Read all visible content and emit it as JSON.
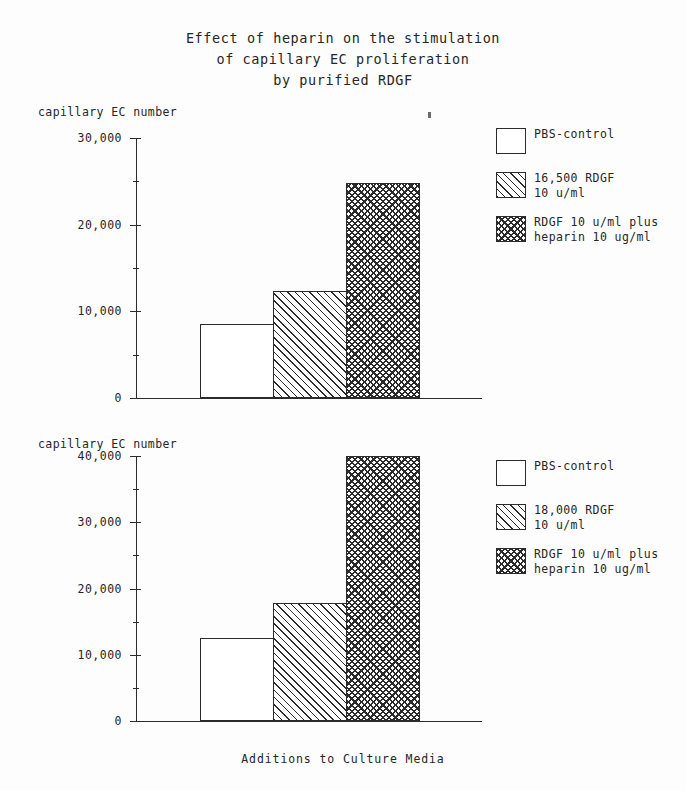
{
  "figure": {
    "title_lines": [
      "Effect of heparin on the stimulation",
      "of capillary EC proliferation",
      "by purified RDGF"
    ],
    "xlabel": "Additions to Culture Media"
  },
  "chart_data": [
    {
      "type": "bar",
      "panel": "top",
      "title": "Effect of heparin on the stimulation of capillary EC proliferation by purified RDGF",
      "ylabel": "capillary EC number",
      "xlabel": "Additions to Culture Media",
      "categories": [
        "PBS-control",
        "16,500 RDGF 10 u/ml",
        "RDGF 10 u/ml plus heparin 10 ug/ml"
      ],
      "values": [
        8500,
        12400,
        24800
      ],
      "ylim": [
        0,
        30000
      ],
      "ytick_labels": [
        "0",
        "10,000",
        "20,000",
        "30,000"
      ],
      "ytick_values": [
        0,
        10000,
        20000,
        30000
      ],
      "yminor_values": [
        5000,
        15000,
        25000
      ],
      "grid": false,
      "legend_position": "right",
      "legend": [
        {
          "pattern": "empty",
          "lines": [
            "PBS-control"
          ]
        },
        {
          "pattern": "hatch",
          "lines": [
            "16,500 RDGF",
            "10 u/ml"
          ]
        },
        {
          "pattern": "cross",
          "lines": [
            "RDGF 10 u/ml plus",
            "heparin 10 ug/ml"
          ]
        }
      ]
    },
    {
      "type": "bar",
      "panel": "bottom",
      "ylabel": "capillary EC number",
      "xlabel": "Additions to Culture Media",
      "categories": [
        "PBS-control",
        "18,000 RDGF 10 u/ml",
        "RDGF 10 u/ml plus heparin 10 ug/ml"
      ],
      "values": [
        12500,
        17800,
        40000
      ],
      "ylim": [
        0,
        40000
      ],
      "ytick_labels": [
        "0",
        "10,000",
        "20,000",
        "30,000",
        "40,000"
      ],
      "ytick_values": [
        0,
        10000,
        20000,
        30000,
        40000
      ],
      "yminor_values": [
        5000,
        15000,
        25000,
        35000
      ],
      "grid": false,
      "legend_position": "right",
      "legend": [
        {
          "pattern": "empty",
          "lines": [
            "PBS-control"
          ]
        },
        {
          "pattern": "hatch",
          "lines": [
            "18,000 RDGF",
            "10 u/ml"
          ]
        },
        {
          "pattern": "cross",
          "lines": [
            "RDGF 10 u/ml plus",
            "heparin 10 ug/ml"
          ]
        }
      ]
    }
  ],
  "top": {
    "ylabel": "capillary EC number",
    "ticks": [
      {
        "label": "30,000",
        "value": 30000
      },
      {
        "label": "20,000",
        "value": 20000
      },
      {
        "label": "10,000",
        "value": 10000
      },
      {
        "label": "0",
        "value": 0
      }
    ],
    "legend": {
      "items": [
        {
          "line1": "PBS-control",
          "line2": ""
        },
        {
          "line1": "16,500 RDGF",
          "line2": "10 u/ml"
        },
        {
          "line1": "RDGF 10 u/ml plus",
          "line2": "heparin 10 ug/ml"
        }
      ]
    }
  },
  "bottom": {
    "ylabel": "capillary EC number",
    "ticks": [
      {
        "label": "40,000",
        "value": 40000
      },
      {
        "label": "30,000",
        "value": 30000
      },
      {
        "label": "20,000",
        "value": 20000
      },
      {
        "label": "10,000",
        "value": 10000
      },
      {
        "label": "0",
        "value": 0
      }
    ],
    "legend": {
      "items": [
        {
          "line1": "PBS-control",
          "line2": ""
        },
        {
          "line1": "18,000 RDGF",
          "line2": "10 u/ml"
        },
        {
          "line1": "RDGF 10 u/ml plus",
          "line2": "heparin 10 ug/ml"
        }
      ]
    }
  }
}
